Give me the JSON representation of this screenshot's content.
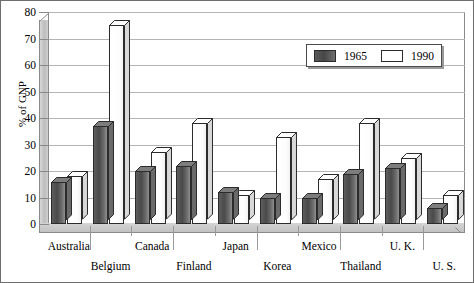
{
  "chart_data": {
    "type": "bar",
    "title": "",
    "xlabel": "",
    "ylabel": "% of GNP",
    "ylim": [
      0,
      80
    ],
    "yticks": [
      0,
      10,
      20,
      30,
      40,
      50,
      60,
      70,
      80
    ],
    "grid": true,
    "legend_position": "top-right",
    "categories": [
      "Australia",
      "Belgium",
      "Canada",
      "Finland",
      "Japan",
      "Korea",
      "Mexico",
      "Thailand",
      "U. K.",
      "U. S."
    ],
    "series": [
      {
        "name": "1965",
        "color": "#4a4a4a",
        "values": [
          16,
          37,
          20,
          22,
          12,
          10,
          10,
          19,
          21,
          6
        ]
      },
      {
        "name": "1990",
        "color": "#ffffff",
        "values": [
          18,
          75,
          27,
          38,
          11,
          33,
          17,
          38,
          25,
          11
        ]
      }
    ]
  },
  "legend": {
    "entries": [
      {
        "label": "1965"
      },
      {
        "label": "1990"
      }
    ]
  },
  "colors": {
    "series_1965": "#4a4a4a",
    "series_1990": "#ffffff",
    "gridline": "#b4b4b4",
    "axis": "#8a8a8a",
    "wall": "#c8c8c8",
    "text": "#000000"
  }
}
